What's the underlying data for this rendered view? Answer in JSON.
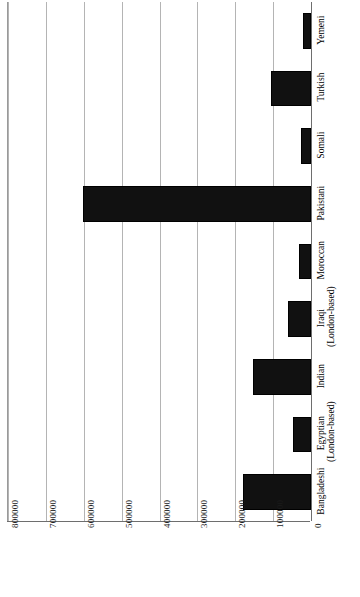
{
  "chart_data": {
    "type": "bar",
    "orientation": "horizontal-rotated",
    "title": "",
    "subtitle": "",
    "xlabel": "",
    "ylabel": "",
    "grid": true,
    "legend": false,
    "legend_position": "none",
    "bar_color": "#111111",
    "gridline_color": "#b4b4b4",
    "axis_color": "#6e6e6e",
    "categories": [
      "Bangladeshi",
      "Egyptian (London-based)",
      "Indian",
      "Iraqi (London-based)",
      "Moroccan",
      "Pakistani",
      "Somali",
      "Turkish",
      "Yemeni"
    ],
    "category_lines": [
      [
        "Bangladeshi",
        ""
      ],
      [
        "Egyptian",
        "(London-based)"
      ],
      [
        "Indian",
        ""
      ],
      [
        "Iraqi",
        "(London-based)"
      ],
      [
        "Moroccan",
        ""
      ],
      [
        "Pakistani",
        ""
      ],
      [
        "Somali",
        ""
      ],
      [
        "Turkish",
        ""
      ],
      [
        "Yemeni",
        ""
      ]
    ],
    "values": [
      180000,
      47000,
      152000,
      60000,
      32000,
      603000,
      27000,
      105000,
      21000
    ],
    "value_axis_ticks": [
      800000,
      700000,
      600000,
      500000,
      400000,
      300000,
      200000,
      100000,
      0
    ],
    "value_axis_tick_labels": [
      "800000",
      "700000",
      "600000",
      "500000",
      "400000",
      "300000",
      "200000",
      "100000",
      "0"
    ],
    "xlim": [
      0,
      800000
    ],
    "ylim": [
      0,
      800000
    ]
  }
}
